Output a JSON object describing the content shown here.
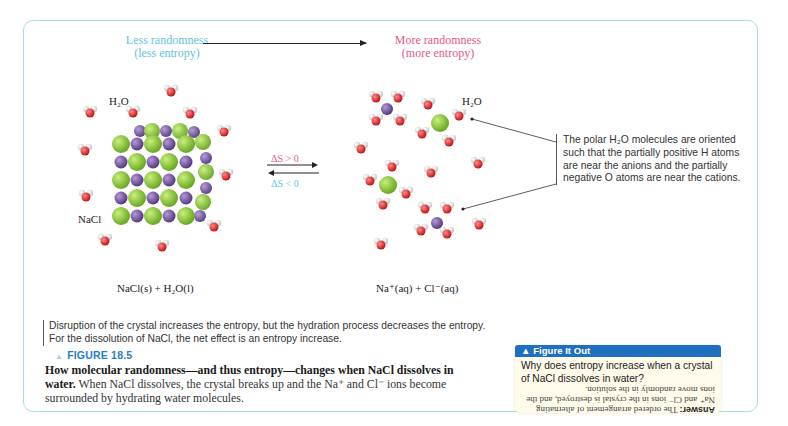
{
  "header": {
    "left_line1": "Less randomness",
    "left_line2": "(less entropy)",
    "right_line1": "More randomness",
    "right_line2": "(more entropy)"
  },
  "labels": {
    "h2o_left": "H₂O",
    "nacl": "NaCl",
    "h2o_right": "H₂O",
    "delta_s_pos": "ΔS > 0",
    "delta_s_neg": "ΔS < 0"
  },
  "callout": {
    "text": "The polar H₂O molecules are oriented such that the partially positive H atoms are near the anions and the partially negative O atoms are near the cations."
  },
  "equations": {
    "left": "NaCl(s) + H₂O(l)",
    "right": "Na⁺(aq) + Cl⁻(aq)"
  },
  "note": {
    "text": "Disruption of the crystal increases the entropy, but the hydration process decreases the entropy. For the dissolution of NaCl, the net effect is an entropy increase."
  },
  "figure": {
    "marker": "▲",
    "label": "FIGURE 18.5",
    "caption_bold": "How molecular randomness—and thus entropy—changes when NaCl dissolves in water.",
    "caption_rest": " When NaCl dissolves, the crystal breaks up and the Na⁺ and Cl⁻ ions become surrounded by hydrating water molecules."
  },
  "figure_it_out": {
    "title": "▲ Figure It Out",
    "question": "Why does entropy increase when a crystal of NaCl dissolves in water?",
    "answer_label": "Answer:",
    "answer_text": " The ordered arrangement of alternating Na⁺ and Cl⁻ ions in the crystal is destroyed, and the ions move randomly in the solution."
  },
  "colors": {
    "less_entropy": "#62c3e0",
    "more_entropy": "#e8578b",
    "frame_border": "#a9dbe8",
    "figure_label": "#2a7dc2",
    "fio_header": "#1f6fc0",
    "fio_bg": "#fffbea",
    "chloride": "#8fcf3c",
    "sodium": "#7a5aa6",
    "oxygen": "#e02828",
    "hydrogen": "#f2f2f2"
  }
}
